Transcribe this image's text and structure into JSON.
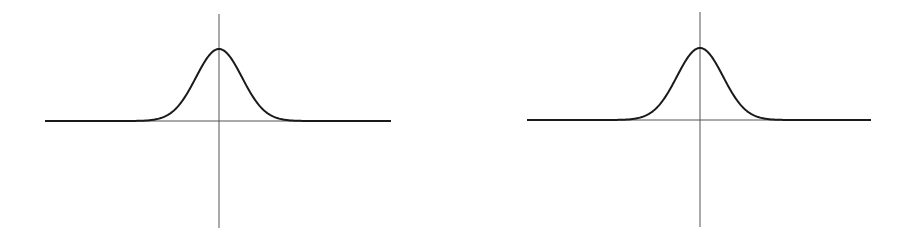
{
  "colors": {
    "curve": "#1a1a1a",
    "axis": "#555555",
    "background": "#ffffff"
  },
  "chart_data": [
    {
      "type": "line",
      "title": "",
      "xlabel": "",
      "ylabel": "",
      "grid": false,
      "description": "Bell-shaped (Gaussian) curve centered on the vertical axis, tails flattening onto the horizontal axis",
      "x": [
        -4,
        -3,
        -2,
        -1.5,
        -1,
        -0.5,
        0,
        0.5,
        1,
        1.5,
        2,
        3,
        4
      ],
      "series": [
        {
          "name": "gaussian",
          "values": [
            0.0003,
            0.011,
            0.135,
            0.325,
            0.607,
            0.882,
            1.0,
            0.882,
            0.607,
            0.325,
            0.135,
            0.011,
            0.0003
          ]
        }
      ],
      "axes": {
        "x_range": [
          -4.5,
          4.5
        ],
        "y_range": [
          -1.5,
          1.2
        ]
      }
    },
    {
      "type": "line",
      "title": "",
      "xlabel": "",
      "ylabel": "",
      "grid": false,
      "description": "Identical bell-shaped (Gaussian) curve centered on the vertical axis",
      "x": [
        -4,
        -3,
        -2,
        -1.5,
        -1,
        -0.5,
        0,
        0.5,
        1,
        1.5,
        2,
        3,
        4
      ],
      "series": [
        {
          "name": "gaussian",
          "values": [
            0.0003,
            0.011,
            0.135,
            0.325,
            0.607,
            0.882,
            1.0,
            0.882,
            0.607,
            0.325,
            0.135,
            0.011,
            0.0003
          ]
        }
      ],
      "axes": {
        "x_range": [
          -4.5,
          4.5
        ],
        "y_range": [
          -1.5,
          1.2
        ]
      }
    }
  ],
  "plots": [
    {
      "cx": 219,
      "axisY": 121,
      "xLeft": 45,
      "xRight": 391,
      "yTop": 14,
      "yBottom": 228,
      "peakY": 49,
      "sigma": 23
    },
    {
      "cx": 700,
      "axisY": 120,
      "xLeft": 527,
      "xRight": 871,
      "yTop": 12,
      "yBottom": 227,
      "peakY": 48,
      "sigma": 23
    }
  ]
}
